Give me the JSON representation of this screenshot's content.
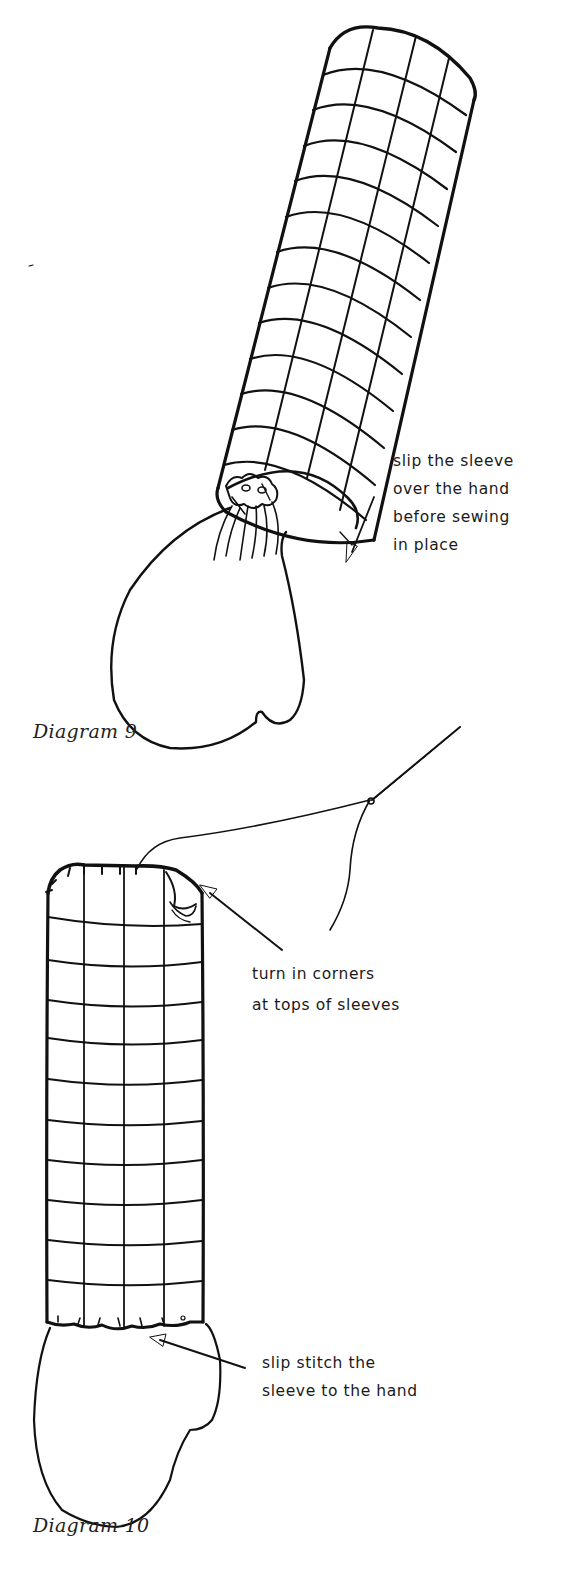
{
  "page": {
    "background": "#ffffff",
    "ink_color": "#111111"
  },
  "diagram_9": {
    "caption": "Diagram 9",
    "annotation": {
      "lines": [
        "slip the sleeve",
        "over the hand",
        "before sewing",
        "in place"
      ]
    },
    "figure": {
      "description": "Gridded tubular sleeve drawn at an angle, with a gathered mitten-shaped hand emerging from the open lower end",
      "arrow_direction": "down-left"
    }
  },
  "diagram_10": {
    "caption": "Diagram 10",
    "annotation_top": {
      "lines": [
        "turn in corners",
        "at tops of sleeves"
      ]
    },
    "annotation_bottom": {
      "lines": [
        "slip stitch the",
        "sleeve to the hand"
      ]
    },
    "figure": {
      "description": "Vertical gridded sleeve with rounded stitched top, threaded needle above, and mitten-shaped hand slip-stitched at the bottom"
    }
  }
}
